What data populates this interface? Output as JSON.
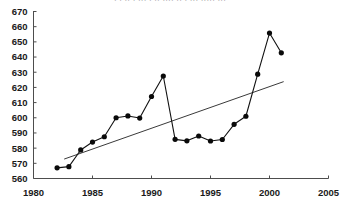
{
  "figure": {
    "cropped_header_text": "· ·  ··  · ··· · ·· ···· ·· · ··· ····· ···",
    "colors": {
      "series": "#111111",
      "trend": "#3a3a3a",
      "axis": "#4d4d4d",
      "text": "#1a1a1a",
      "background": "#ffffff"
    }
  },
  "chart_data": {
    "type": "line",
    "title": "",
    "subtitle": "",
    "xlabel": "",
    "ylabel": "",
    "xlim": [
      1980,
      2005
    ],
    "ylim": [
      560,
      670
    ],
    "grid": false,
    "legend": null,
    "xticks": [
      1980,
      1985,
      1990,
      1995,
      2000,
      2005
    ],
    "xtick_labels": [
      "1980",
      "1985",
      "1990",
      "1995",
      "2000",
      "2005"
    ],
    "yticks": [
      560,
      570,
      580,
      590,
      600,
      610,
      620,
      630,
      640,
      650,
      660,
      670
    ],
    "ytick_labels": [
      "560",
      "570",
      "580",
      "590",
      "600",
      "610",
      "620",
      "630",
      "640",
      "650",
      "660",
      "670"
    ],
    "x": [
      1982,
      1983,
      1984,
      1985,
      1986,
      1987,
      1988,
      1989,
      1990,
      1991,
      1992,
      1993,
      1994,
      1995,
      1996,
      1997,
      1998,
      1999,
      2000,
      2001
    ],
    "series": [
      {
        "name": "data",
        "marker": "filled-circle",
        "values": [
          567,
          567.8,
          578.8,
          584,
          587.5,
          600,
          601.2,
          599.8,
          614,
          627.5,
          585.8,
          584.8,
          588,
          584.7,
          585.7,
          595.7,
          601,
          628.7,
          655.8,
          642.8
        ]
      }
    ],
    "trendline": {
      "type": "linear",
      "x": [
        1982.6,
        2001.2
      ],
      "y": [
        572.8,
        623.8
      ]
    }
  }
}
